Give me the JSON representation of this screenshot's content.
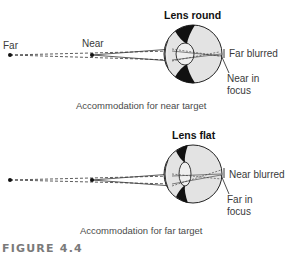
{
  "figure": {
    "label": "FIGURE 4.4"
  },
  "panels": [
    {
      "title": "Lens round",
      "caption": "Accommodation for near target",
      "points": {
        "far_label": "Far",
        "near_label": "Near"
      },
      "annotations": {
        "top": "Far blurred",
        "bottom_line1": "Near in",
        "bottom_line2": "focus"
      }
    },
    {
      "title": "Lens flat",
      "caption": "Accommodation for far target",
      "points": {
        "far_label": "",
        "near_label": ""
      },
      "annotations": {
        "top": "Near blurred",
        "bottom_line1": "Far in",
        "bottom_line2": "focus"
      }
    }
  ],
  "colors": {
    "ink": "#1a1a1a",
    "eye_fill": "#e2e2e2",
    "lens_fill": "#ececec",
    "muscle": "#111111",
    "figure_label": "#7a7a7a"
  }
}
